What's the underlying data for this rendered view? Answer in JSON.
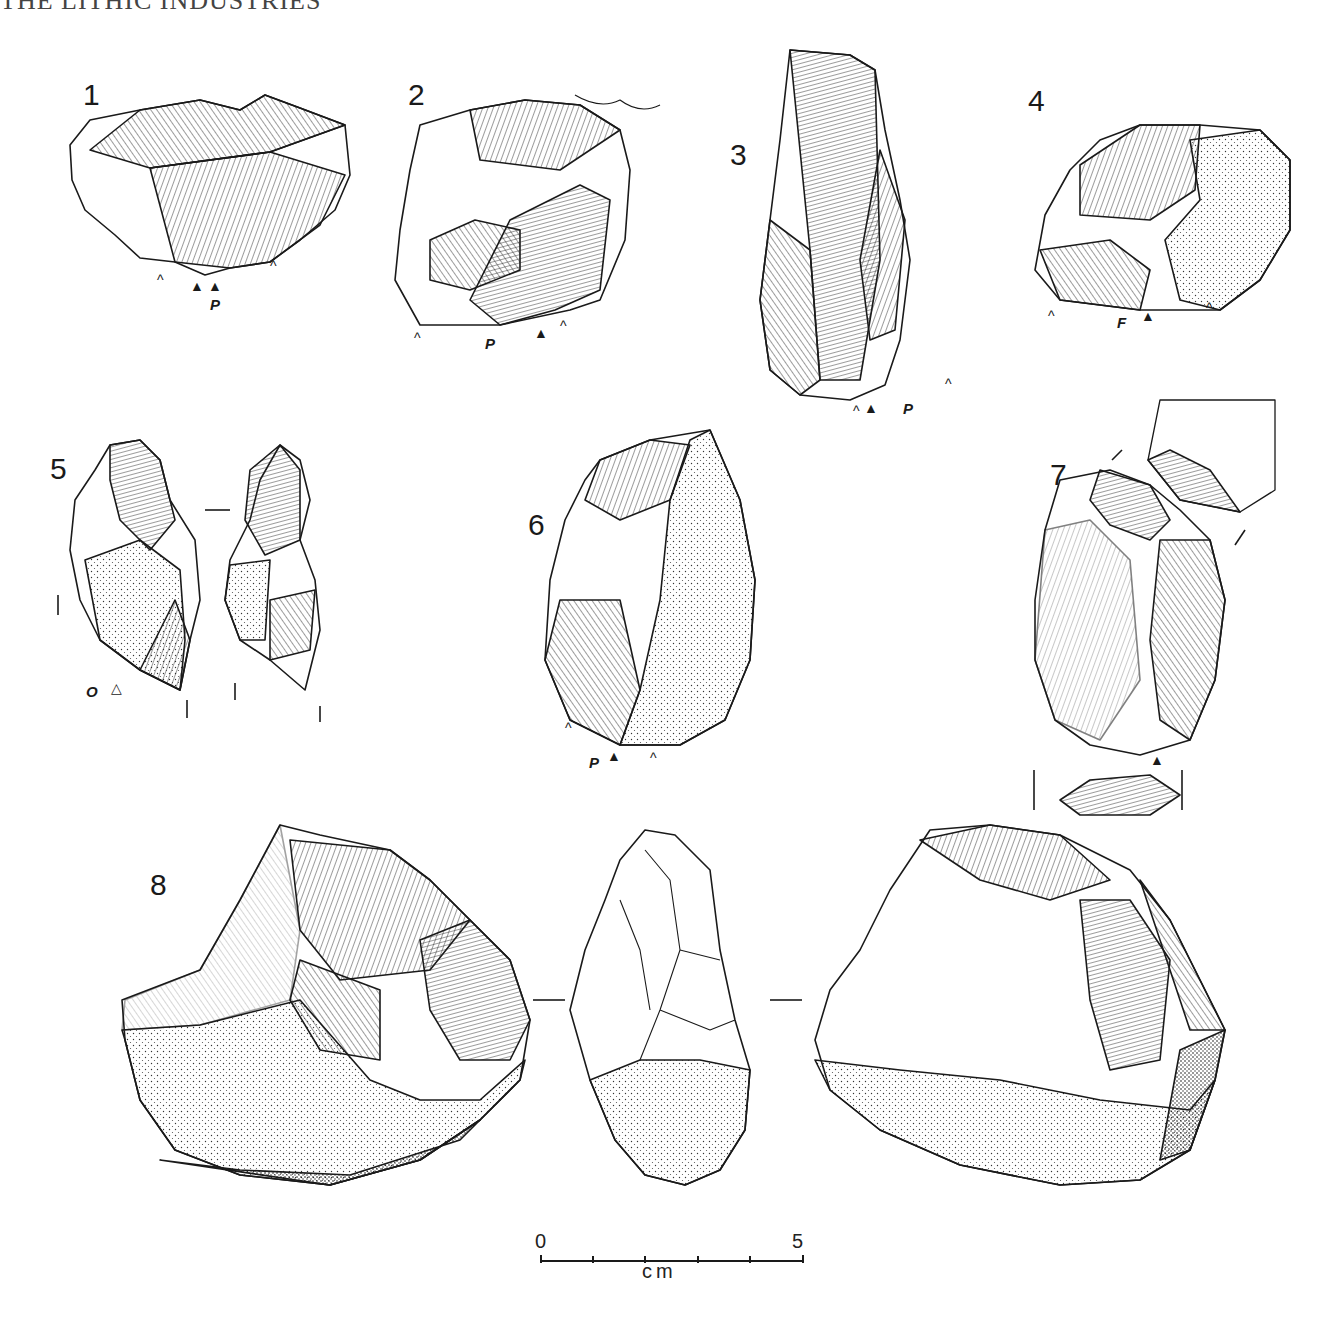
{
  "header": {
    "running_title": "THE LITHIC INDUSTRIES"
  },
  "figures": [
    {
      "num": "1",
      "marks": [
        "^",
        "▲",
        "▲",
        "P",
        "^"
      ]
    },
    {
      "num": "2",
      "marks": [
        "^",
        "P",
        "▲",
        "^"
      ]
    },
    {
      "num": "3",
      "marks": [
        "^",
        "▲",
        "P",
        "^"
      ]
    },
    {
      "num": "4",
      "marks": [
        "^",
        "F",
        "▲",
        "^"
      ]
    },
    {
      "num": "5",
      "marks": [
        "O",
        "△"
      ]
    },
    {
      "num": "6",
      "marks": [
        "^",
        "P",
        "▲",
        "^"
      ]
    },
    {
      "num": "7",
      "marks": [
        "▲"
      ]
    },
    {
      "num": "8",
      "marks": []
    }
  ],
  "labels": {
    "p": "P",
    "f": "F",
    "o": "O",
    "solid_triangle": "▲",
    "open_triangle": "△",
    "chevron": "^"
  },
  "scale_bar": {
    "start": "0",
    "end": "5",
    "unit": "cm",
    "ticks": 5
  }
}
